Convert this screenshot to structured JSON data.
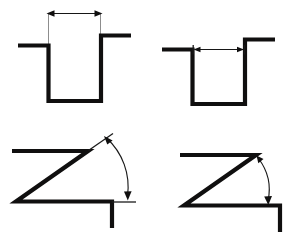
{
  "figure": {
    "background_color": "#ffffff",
    "line_color": "#100f0f",
    "extension_line_color": "#8d8d8d",
    "dimension_line_color": "#161616",
    "panels": [
      {
        "id": "top-left",
        "name": "channel-outer-width",
        "caption": "",
        "feature": "channel-profile",
        "dimension_type": "linear-width",
        "dimension_placement": "above-part, outer-to-outer",
        "arrow_style": "double-headed, pointing outward",
        "arrowheads": 2
      },
      {
        "id": "top-right",
        "name": "channel-inner-width",
        "caption": "",
        "feature": "channel-profile",
        "dimension_type": "linear-width",
        "dimension_placement": "at-part-top, inner-to-inner",
        "arrow_style": "double-headed, pointing outward",
        "arrowheads": 2
      },
      {
        "id": "bottom-left",
        "name": "z-profile-angle-outer",
        "caption": "",
        "feature": "z-profile",
        "dimension_type": "angular",
        "dimension_placement": "offset arc outside vertex",
        "arrow_style": "double-headed arc",
        "arrowheads": 2
      },
      {
        "id": "bottom-right",
        "name": "z-profile-angle-inner",
        "caption": "",
        "feature": "z-profile",
        "dimension_type": "angular",
        "dimension_placement": "arc at vertex",
        "arrow_style": "double-headed arc",
        "arrowheads": 2
      }
    ]
  }
}
